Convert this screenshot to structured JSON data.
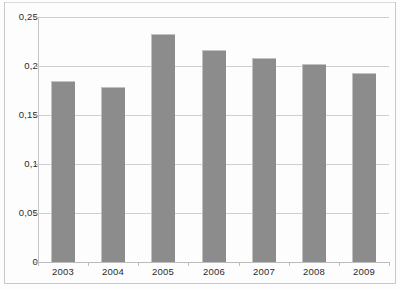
{
  "title_ghost": "",
  "chart_data": {
    "type": "bar",
    "title": "",
    "subtitle": "",
    "xlabel": "",
    "ylabel": "",
    "categories": [
      "2003",
      "2004",
      "2005",
      "2006",
      "2007",
      "2008",
      "2009"
    ],
    "values": [
      0.185,
      0.179,
      0.233,
      0.216,
      0.208,
      0.202,
      0.193
    ],
    "series": [
      {
        "name": "",
        "values": [
          0.185,
          0.179,
          0.233,
          0.216,
          0.208,
          0.202,
          0.193
        ]
      }
    ],
    "ylim": [
      0,
      0.25
    ],
    "ytick_values": [
      0.25,
      0.2,
      0.15,
      0.1,
      0.05,
      0
    ],
    "ytick_labels": [
      "0,25",
      "0,2",
      "0,15",
      "0,1",
      "0,05",
      "0"
    ],
    "xtick_labels": [
      "2003",
      "2004",
      "2005",
      "2006",
      "2007",
      "2008",
      "2009"
    ],
    "grid": true,
    "grid_axis": "y",
    "legend": false,
    "legend_position": "none",
    "decimal_separator": ",",
    "bar_color": "#8c8c8c",
    "gridline_color": "#cfcfcf",
    "background_color": "#fdfdfd",
    "annotations": []
  }
}
